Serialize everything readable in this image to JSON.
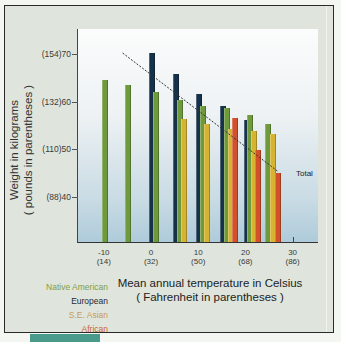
{
  "chart_data": {
    "type": "bar",
    "title": "",
    "xlabel": "Mean annual temperature in Celsius",
    "xlabel_sub": "( Fahrenheit in parentheses )",
    "ylabel": "Weight in kilograms",
    "ylabel_sub": "( pounds in parentheses )",
    "ylim": [
      30,
      75
    ],
    "xlim": [
      -15,
      35
    ],
    "grid": false,
    "legend_position": "bottom-left",
    "y_ticks": [
      {
        "value": 70,
        "label": "(154)70"
      },
      {
        "value": 60,
        "label": "(132)60"
      },
      {
        "value": 50,
        "label": "(110)50"
      },
      {
        "value": 40,
        "label": "(88)40"
      }
    ],
    "x_ticks": [
      {
        "value": -10,
        "label": "-10",
        "sub": "(14)"
      },
      {
        "value": 0,
        "label": "0",
        "sub": "(32)"
      },
      {
        "value": 10,
        "label": "10",
        "sub": "(50)"
      },
      {
        "value": 20,
        "label": "20",
        "sub": "(68)"
      },
      {
        "value": 30,
        "label": "30",
        "sub": "(86)"
      }
    ],
    "series": [
      {
        "name": "Native American",
        "color": "#6e9a3c",
        "points": [
          {
            "x": -10,
            "y": 64.3
          },
          {
            "x": -5,
            "y": 63.3
          },
          {
            "x": 0,
            "y": 61.8
          },
          {
            "x": 5,
            "y": 60.1
          },
          {
            "x": 10,
            "y": 58.9
          },
          {
            "x": 15,
            "y": 58.5
          },
          {
            "x": 20,
            "y": 57.0
          },
          {
            "x": 25,
            "y": 55.1
          }
        ]
      },
      {
        "name": "European",
        "color": "#16324a",
        "points": [
          {
            "x": 0,
            "y": 70.0
          },
          {
            "x": 5,
            "y": 65.6
          },
          {
            "x": 10,
            "y": 61.4
          },
          {
            "x": 15,
            "y": 58.9
          },
          {
            "x": 20,
            "y": 56.0
          }
        ]
      },
      {
        "name": "S.E. Asian",
        "color": "#d6b330",
        "points": [
          {
            "x": 5,
            "y": 56.2
          },
          {
            "x": 10,
            "y": 55.1
          },
          {
            "x": 15,
            "y": 54.1
          },
          {
            "x": 20,
            "y": 53.6
          },
          {
            "x": 25,
            "y": 53.0
          }
        ]
      },
      {
        "name": "African",
        "color": "#d2512a",
        "points": [
          {
            "x": 15,
            "y": 56.4
          },
          {
            "x": 20,
            "y": 49.7
          },
          {
            "x": 25,
            "y": 44.8
          }
        ]
      }
    ],
    "trend_line": {
      "name": "Total",
      "style": "dashed",
      "from": {
        "x": -6,
        "y": 70.2
      },
      "to": {
        "x": 27,
        "y": 45.3
      }
    }
  },
  "legend": [
    {
      "label": "Native American",
      "color": "#7f9d4a"
    },
    {
      "label": "European",
      "color": "#1e2a36"
    },
    {
      "label": "S.E. Asian",
      "color": "#c99a5a"
    },
    {
      "label": "African",
      "color": "#c8673a"
    }
  ]
}
